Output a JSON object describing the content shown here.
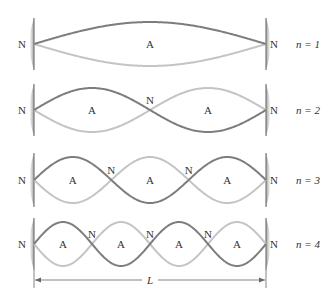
{
  "diagram": {
    "colors": {
      "dark_curve": "#7d7d7d",
      "light_curve": "#c4c4c4",
      "wall": "#9a9a9a",
      "text": "#333333"
    },
    "node_label": "N",
    "antinode_label": "A",
    "length_label": "L",
    "rows": [
      {
        "n": 1,
        "harmonic_label": "n = 1",
        "center_y": 44,
        "amplitude": 22
      },
      {
        "n": 2,
        "harmonic_label": "n = 2",
        "center_y": 110,
        "amplitude": 22
      },
      {
        "n": 3,
        "harmonic_label": "n = 3",
        "center_y": 180,
        "amplitude": 23
      },
      {
        "n": 4,
        "harmonic_label": "n = 4",
        "center_y": 244,
        "amplitude": 22
      }
    ],
    "left_x": 34,
    "right_x": 266,
    "dimension_y": 280
  }
}
